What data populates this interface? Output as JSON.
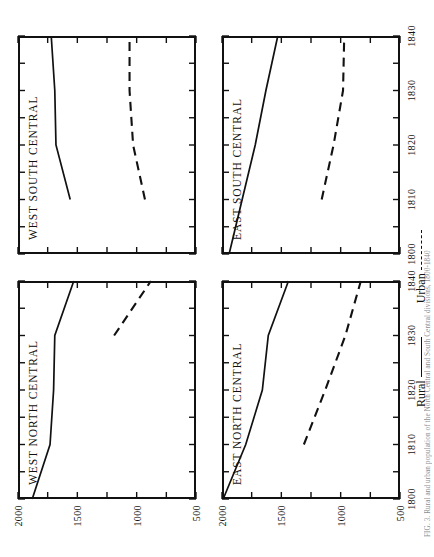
{
  "figure": {
    "orientation": "rotated-90-ccw",
    "caption": "FIG. 3. Rural and urban population of the North Central and South Central divisions, 1800-1840",
    "legend": {
      "position": "bottom-center",
      "entries": [
        {
          "label": "Rural",
          "style": "solid",
          "dash_suffix": ""
        },
        {
          "label": "Urban",
          "style": "dashed",
          "dash_suffix": "- - -"
        }
      ]
    },
    "axes": {
      "x": {
        "label": "",
        "min": 1800,
        "max": 1840,
        "major_ticks": [
          1800,
          1810,
          1820,
          1830,
          1840
        ],
        "minor_ticks": [
          1805,
          1815,
          1825,
          1835
        ],
        "tick_labels": [
          "1800",
          "1810",
          "1820",
          "1830",
          "1840"
        ]
      },
      "y": {
        "label": "",
        "min": 500,
        "max": 2000,
        "major_ticks": [
          2000,
          1500,
          1000,
          500
        ],
        "minor_ticks": [
          1750,
          1250,
          750
        ],
        "tick_labels": [
          "2000",
          "1500",
          "1000",
          "500"
        ]
      },
      "grid": false
    }
  },
  "chart_data": [
    {
      "type": "line",
      "title": "WEST NORTH CENTRAL",
      "panel": "top-left",
      "xlabel": "",
      "ylabel": "",
      "xlim": [
        1800,
        1840
      ],
      "ylim": [
        500,
        2000
      ],
      "x": [
        1800,
        1810,
        1820,
        1830,
        1840
      ],
      "series": [
        {
          "name": "Rural",
          "style": "solid",
          "x": [
            1800,
            1810,
            1820,
            1830,
            1840
          ],
          "values": [
            1880,
            1730,
            1700,
            1690,
            1530
          ]
        },
        {
          "name": "Urban",
          "style": "dashed",
          "x": [
            1830,
            1840
          ],
          "values": [
            1190,
            880
          ]
        }
      ]
    },
    {
      "type": "line",
      "title": "EAST NORTH CENTRAL",
      "panel": "bottom-left",
      "xlabel": "",
      "ylabel": "",
      "xlim": [
        1800,
        1840
      ],
      "ylim": [
        500,
        2000
      ],
      "x": [
        1800,
        1810,
        1820,
        1830,
        1840
      ],
      "series": [
        {
          "name": "Rural",
          "style": "solid",
          "x": [
            1800,
            1810,
            1820,
            1830,
            1840
          ],
          "values": [
            1990,
            1800,
            1660,
            1610,
            1440
          ]
        },
        {
          "name": "Urban",
          "style": "dashed",
          "x": [
            1810,
            1820,
            1830,
            1840
          ],
          "values": [
            1310,
            1130,
            960,
            830
          ]
        }
      ]
    },
    {
      "type": "line",
      "title": "WEST SOUTH CENTRAL",
      "panel": "top-right",
      "xlabel": "",
      "ylabel": "",
      "xlim": [
        1800,
        1840
      ],
      "ylim": [
        500,
        2000
      ],
      "x": [
        1800,
        1810,
        1820,
        1830,
        1840
      ],
      "series": [
        {
          "name": "Rural",
          "style": "solid",
          "x": [
            1810,
            1820,
            1830,
            1840
          ],
          "values": [
            1560,
            1680,
            1690,
            1720
          ]
        },
        {
          "name": "Urban",
          "style": "dashed",
          "x": [
            1810,
            1820,
            1830,
            1840
          ],
          "values": [
            930,
            1030,
            1060,
            1060
          ]
        }
      ]
    },
    {
      "type": "line",
      "title": "EAST SOUTH CENTRAL",
      "panel": "bottom-right",
      "xlabel": "",
      "ylabel": "",
      "xlim": [
        1800,
        1840
      ],
      "ylim": [
        500,
        2000
      ],
      "x": [
        1800,
        1810,
        1820,
        1830,
        1840
      ],
      "series": [
        {
          "name": "Rural",
          "style": "solid",
          "x": [
            1800,
            1810,
            1820,
            1830,
            1840
          ],
          "values": [
            1940,
            1830,
            1720,
            1630,
            1530
          ]
        },
        {
          "name": "Urban",
          "style": "dashed",
          "x": [
            1810,
            1820,
            1830,
            1840
          ],
          "values": [
            1160,
            1060,
            980,
            970
          ]
        }
      ]
    }
  ]
}
